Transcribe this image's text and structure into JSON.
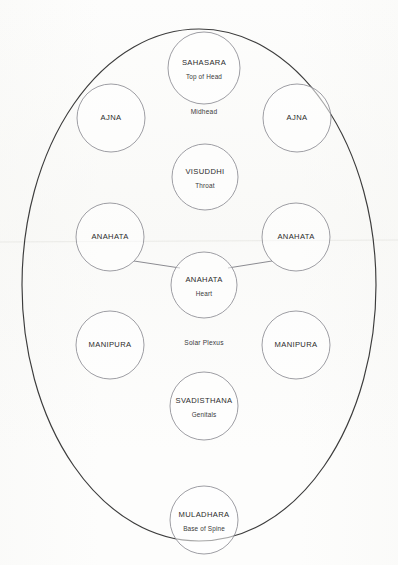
{
  "diagram": {
    "outline": {
      "name": "body-ellipse",
      "cx": 199,
      "cy": 285,
      "rx": 177,
      "ry": 256,
      "stroke": "#3c3c3c"
    },
    "free_labels": [
      {
        "id": "midhead",
        "text": "Midhead",
        "x": 204,
        "y": 112
      },
      {
        "id": "solar-plexus",
        "text": "Solar Plexus",
        "x": 204,
        "y": 343
      }
    ],
    "nodes": [
      {
        "id": "sahasara",
        "title": "SAHASARA",
        "subtitle": "Top of Head",
        "cx": 204,
        "cy": 68,
        "r": 36
      },
      {
        "id": "ajna-left",
        "title": "AJNA",
        "subtitle": "",
        "cx": 111,
        "cy": 118,
        "r": 34
      },
      {
        "id": "ajna-right",
        "title": "AJNA",
        "subtitle": "",
        "cx": 297,
        "cy": 118,
        "r": 34
      },
      {
        "id": "visuddhi",
        "title": "VISUDDHI",
        "subtitle": "Throat",
        "cx": 205,
        "cy": 177,
        "r": 33
      },
      {
        "id": "anahata-left",
        "title": "ANAHATA",
        "subtitle": "",
        "cx": 110,
        "cy": 237,
        "r": 34
      },
      {
        "id": "anahata-right",
        "title": "ANAHATA",
        "subtitle": "",
        "cx": 296,
        "cy": 237,
        "r": 34
      },
      {
        "id": "anahata-center",
        "title": "ANAHATA",
        "subtitle": "Heart",
        "cx": 204,
        "cy": 285,
        "r": 33
      },
      {
        "id": "manipura-left",
        "title": "MANIPURA",
        "subtitle": "",
        "cx": 110,
        "cy": 345,
        "r": 34
      },
      {
        "id": "manipura-right",
        "title": "MANIPURA",
        "subtitle": "",
        "cx": 296,
        "cy": 345,
        "r": 34
      },
      {
        "id": "svadisthana",
        "title": "SVADISTHANA",
        "subtitle": "Genitals",
        "cx": 204,
        "cy": 406,
        "r": 34
      },
      {
        "id": "muladhara",
        "title": "MULADHARA",
        "subtitle": "Base of Spine",
        "cx": 204,
        "cy": 520,
        "r": 34
      }
    ],
    "links": [
      {
        "id": "link-anahata-left-center",
        "from": "anahata-left",
        "to": "anahata-center",
        "x1": 134,
        "y1": 261,
        "x2": 180,
        "y2": 268
      },
      {
        "id": "link-anahata-right-center",
        "from": "anahata-right",
        "to": "anahata-center",
        "x1": 272,
        "y1": 261,
        "x2": 228,
        "y2": 268
      }
    ],
    "artifacts": [
      {
        "id": "scan-line",
        "x1": 0,
        "y1": 242,
        "x2": 398,
        "y2": 240
      }
    ]
  }
}
